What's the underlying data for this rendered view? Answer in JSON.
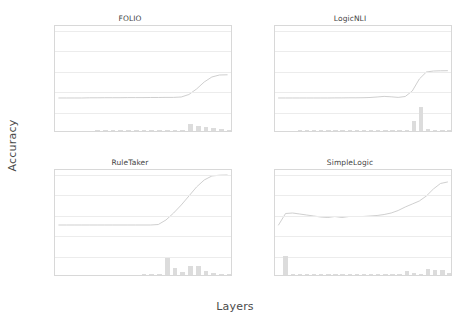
{
  "figure": {
    "xlabel": "Layers",
    "ylabel": "Accuracy"
  },
  "colors": {
    "line": "#c9c9c9",
    "bar": "#dcdcdc",
    "grid": "#ececec",
    "axis": "#d8d8d8",
    "text": "#444444"
  },
  "chart_data": [
    {
      "type": "line",
      "title": "FOLIO",
      "xlabel": "Layers",
      "ylabel": "Accuracy",
      "ylim": [
        0,
        105
      ],
      "yticks": [
        0.0,
        20.0,
        40.0,
        60.0,
        80.0,
        100.0
      ],
      "ytick_labels": [
        "0.0",
        "20.0",
        "40.0",
        "60.0",
        "80.0",
        "100.0"
      ],
      "xticks": [],
      "xtick_labels": [],
      "grid": true,
      "legend": "none",
      "x": [
        0,
        1,
        2,
        3,
        4,
        5,
        6,
        7,
        8,
        9,
        10,
        11,
        12,
        13,
        14,
        15,
        16,
        17,
        18,
        19,
        20,
        21,
        22
      ],
      "series": [
        {
          "name": "accuracy-line",
          "values": [
            33.0,
            33.0,
            33.0,
            33.0,
            33.2,
            33.2,
            33.3,
            33.3,
            33.3,
            33.4,
            33.4,
            33.4,
            33.5,
            33.5,
            33.6,
            33.6,
            34.0,
            36.5,
            42.0,
            49.0,
            54.0,
            56.0,
            56.2
          ]
        }
      ],
      "bars": {
        "name": "entropy-bars",
        "values": [
          0,
          0,
          0,
          0,
          0,
          1.0,
          0.8,
          0.6,
          0.5,
          0.4,
          0.4,
          0.4,
          0.3,
          0.3,
          0.3,
          0.3,
          0.4,
          6.5,
          5.0,
          4.0,
          2.5,
          1.5,
          0.8
        ]
      }
    },
    {
      "type": "line",
      "title": "LogicNLI",
      "xlabel": "Layers",
      "ylabel": "Accuracy",
      "ylim": [
        0,
        105
      ],
      "yticks": [
        0.0,
        20.0,
        40.0,
        60.0,
        80.0,
        100.0
      ],
      "ytick_labels": [
        "0.0",
        "20.0",
        "40.0",
        "60.0",
        "80.0",
        "100.0"
      ],
      "xticks": [],
      "xtick_labels": [],
      "grid": true,
      "legend": "none",
      "x": [
        0,
        1,
        2,
        3,
        4,
        5,
        6,
        7,
        8,
        9,
        10,
        11,
        12,
        13,
        14,
        15,
        16,
        17,
        18,
        19,
        20,
        21,
        22,
        23,
        24
      ],
      "series": [
        {
          "name": "accuracy-line",
          "values": [
            33.0,
            33.0,
            33.0,
            33.0,
            33.0,
            33.0,
            33.0,
            33.0,
            33.1,
            33.1,
            33.2,
            33.2,
            33.3,
            33.5,
            34.0,
            34.6,
            34.2,
            33.6,
            34.5,
            40.0,
            52.0,
            59.0,
            60.0,
            60.2,
            60.3
          ]
        }
      ],
      "bars": {
        "name": "entropy-bars",
        "values": [
          0,
          0,
          0,
          0.5,
          0.3,
          0.3,
          0.3,
          0.4,
          0.3,
          0.3,
          0.3,
          0.3,
          0.3,
          0.4,
          0.4,
          0.5,
          1.2,
          0.6,
          0.5,
          10.0,
          24.0,
          2.0,
          0.6,
          0.4,
          0.3
        ]
      }
    },
    {
      "type": "line",
      "title": "RuleTaker",
      "xlabel": "Layers",
      "ylabel": "Accuracy",
      "ylim": [
        0,
        105
      ],
      "yticks": [
        0.0,
        20.0,
        40.0,
        60.0,
        80.0,
        100.0
      ],
      "ytick_labels": [
        "0.0",
        "20.0",
        "40.0",
        "60.0",
        "80.0",
        "100.0"
      ],
      "xticks": [
        0,
        1,
        2,
        3,
        4,
        5,
        6,
        7,
        8,
        9,
        10,
        11,
        12,
        13,
        14,
        15,
        16,
        17,
        18,
        19,
        20,
        21,
        22
      ],
      "xtick_labels": [
        "0",
        "1",
        "2",
        "3",
        "4",
        "5",
        "6",
        "7",
        "8",
        "9",
        "10",
        "11",
        "12",
        "13",
        "14",
        "15",
        "16",
        "17",
        "18",
        "19",
        "20",
        "21",
        "22"
      ],
      "grid": true,
      "legend": "none",
      "x": [
        0,
        1,
        2,
        3,
        4,
        5,
        6,
        7,
        8,
        9,
        10,
        11,
        12,
        13,
        14,
        15,
        16,
        17,
        18,
        19,
        20,
        21,
        22
      ],
      "series": [
        {
          "name": "accuracy-line",
          "values": [
            50.0,
            50.0,
            50.0,
            50.0,
            50.0,
            50.0,
            50.0,
            50.0,
            50.0,
            50.0,
            50.0,
            50.0,
            50.0,
            50.5,
            55.0,
            62.0,
            70.0,
            79.0,
            88.0,
            95.0,
            99.0,
            99.8,
            100.0
          ]
        }
      ],
      "bars": {
        "name": "entropy-bars",
        "values": [
          0,
          0,
          0,
          0,
          0,
          0,
          0,
          0,
          0,
          0,
          0,
          0.4,
          0.3,
          0.3,
          17.0,
          7.0,
          3.0,
          9.0,
          9.0,
          3.5,
          2.0,
          1.0,
          0.6
        ]
      }
    },
    {
      "type": "line",
      "title": "SimpleLogic",
      "xlabel": "Layers",
      "ylabel": "Accuracy",
      "ylim": [
        0,
        105
      ],
      "yticks": [
        0.0,
        20.0,
        40.0,
        60.0,
        80.0,
        100.0
      ],
      "ytick_labels": [
        "0.0",
        "20.0",
        "40.0",
        "60.0",
        "80.0",
        "100.0"
      ],
      "xticks": [
        0,
        1,
        2,
        3,
        4,
        5,
        6,
        7,
        8,
        9,
        10,
        11,
        12,
        13,
        14,
        15,
        16,
        17,
        18,
        19,
        20,
        21,
        22,
        23,
        24
      ],
      "xtick_labels": [
        "0",
        "1",
        "2",
        "3",
        "4",
        "5",
        "6",
        "7",
        "8",
        "9",
        "10",
        "11",
        "12",
        "13",
        "14",
        "15",
        "16",
        "17",
        "18",
        "19",
        "20",
        "21",
        "22",
        "23",
        "24"
      ],
      "grid": true,
      "legend": "none",
      "x": [
        0,
        1,
        2,
        3,
        4,
        5,
        6,
        7,
        8,
        9,
        10,
        11,
        12,
        13,
        14,
        15,
        16,
        17,
        18,
        19,
        20,
        21,
        22,
        23,
        24
      ],
      "series": [
        {
          "name": "accuracy-line",
          "values": [
            50.0,
            61.5,
            62.0,
            61.0,
            60.0,
            59.0,
            58.0,
            57.5,
            58.5,
            57.5,
            58.5,
            58.5,
            58.5,
            59.0,
            59.5,
            60.5,
            62.0,
            64.5,
            68.0,
            71.0,
            74.0,
            79.0,
            86.0,
            91.5,
            93.0
          ]
        }
      ],
      "bars": {
        "name": "entropy-bars",
        "values": [
          0,
          19.0,
          1.0,
          0.5,
          0.4,
          1.0,
          1.2,
          0.4,
          0.4,
          0.5,
          0.6,
          0.5,
          0.5,
          0.6,
          0.6,
          0.8,
          1.0,
          1.4,
          4.0,
          2.0,
          1.2,
          5.5,
          5.0,
          4.5,
          2.0
        ]
      }
    }
  ]
}
